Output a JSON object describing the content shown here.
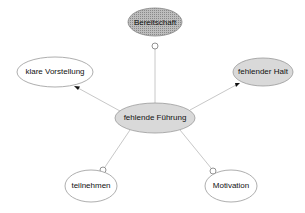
{
  "diagram": {
    "type": "mind-map",
    "center": {
      "id": "fuehrung",
      "label": "fehlende Führung",
      "cx": 155,
      "cy": 118,
      "rx": 40,
      "ry": 15,
      "fill": "#d9d9d9"
    },
    "nodes": [
      {
        "id": "bereitschaft",
        "label": "Bereitschaft",
        "cx": 155,
        "cy": 22,
        "rx": 27,
        "ry": 14,
        "fill": "hatched"
      },
      {
        "id": "vorstellung",
        "label": "klare Vorstellung",
        "cx": 55,
        "cy": 72,
        "rx": 38,
        "ry": 15,
        "fill": "#ffffff"
      },
      {
        "id": "halt",
        "label": "fehlender Halt",
        "cx": 263,
        "cy": 72,
        "rx": 30,
        "ry": 14,
        "fill": "#d9d9d9"
      },
      {
        "id": "teilnehmen",
        "label": "teilnehmen",
        "cx": 91,
        "cy": 186,
        "rx": 26,
        "ry": 16,
        "fill": "#ffffff"
      },
      {
        "id": "motivation",
        "label": "Motivation",
        "cx": 231,
        "cy": 186,
        "rx": 26,
        "ry": 16,
        "fill": "#ffffff"
      }
    ],
    "edges": [
      {
        "from": "fuehrung",
        "to": "bereitschaft",
        "end": "circle"
      },
      {
        "from": "fuehrung",
        "to": "vorstellung",
        "end": "arrow"
      },
      {
        "from": "fuehrung",
        "to": "halt",
        "end": "arrow"
      },
      {
        "from": "fuehrung",
        "to": "teilnehmen",
        "end": "circle"
      },
      {
        "from": "fuehrung",
        "to": "motivation",
        "end": "circle"
      }
    ],
    "colors": {
      "edge": "#c8c8c8",
      "stroke": "#888888",
      "gray_fill": "#d9d9d9",
      "text": "#111111"
    }
  }
}
